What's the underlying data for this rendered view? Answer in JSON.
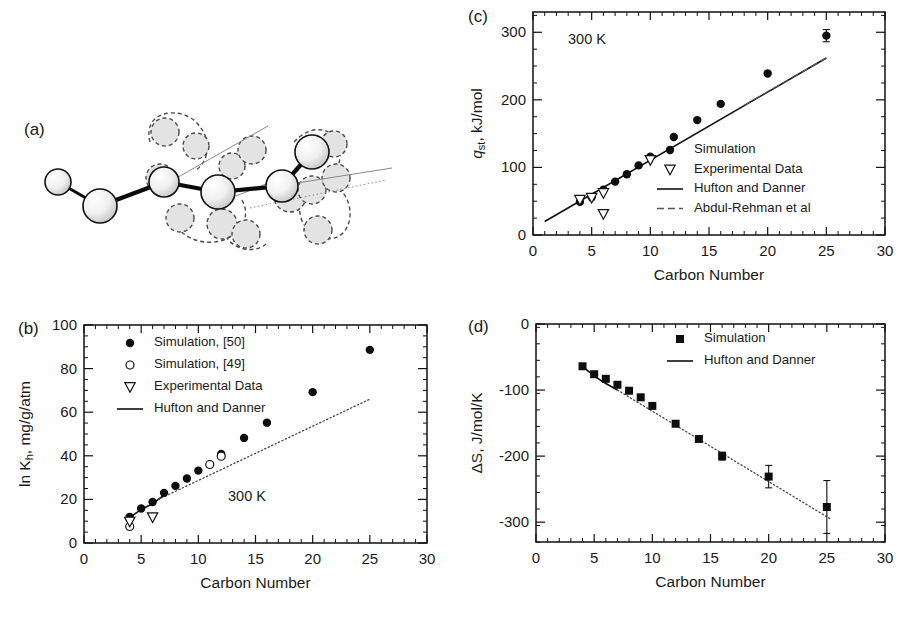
{
  "figure": {
    "panels": [
      "(a)",
      "(b)",
      "(c)",
      "(d)"
    ],
    "xlabel_common": "Carbon Number"
  },
  "panel_a": {
    "tag": "(a)",
    "caption_text": "",
    "description": "united-atom alkane chain schematic with ghost conformations",
    "solid_atoms": [
      {
        "cx": 58,
        "cy": 182,
        "r": 13
      },
      {
        "cx": 100,
        "cy": 206,
        "r": 17
      },
      {
        "cx": 164,
        "cy": 182,
        "r": 15
      },
      {
        "cx": 218,
        "cy": 192,
        "r": 17
      },
      {
        "cx": 282,
        "cy": 186,
        "r": 16
      },
      {
        "cx": 312,
        "cy": 152,
        "r": 17
      }
    ],
    "ghost_atoms": [
      {
        "cx": 165,
        "cy": 132,
        "r": 14
      },
      {
        "cx": 196,
        "cy": 146,
        "r": 13
      },
      {
        "cx": 160,
        "cy": 178,
        "r": 14
      },
      {
        "cx": 180,
        "cy": 218,
        "r": 14
      },
      {
        "cx": 222,
        "cy": 224,
        "r": 15
      },
      {
        "cx": 246,
        "cy": 234,
        "r": 14
      },
      {
        "cx": 232,
        "cy": 166,
        "r": 13
      },
      {
        "cx": 252,
        "cy": 150,
        "r": 14
      },
      {
        "cx": 290,
        "cy": 196,
        "r": 16
      },
      {
        "cx": 312,
        "cy": 190,
        "r": 14
      },
      {
        "cx": 318,
        "cy": 230,
        "r": 14
      },
      {
        "cx": 334,
        "cy": 144,
        "r": 13
      },
      {
        "cx": 336,
        "cy": 178,
        "r": 14
      }
    ],
    "ghost_loops": [
      "M150,142 C142,110 180,106 196,122 C214,140 208,162 196,170",
      "M176,206 C166,236 206,250 228,238 C250,226 248,206 240,198",
      "M226,216 C214,244 250,258 266,244",
      "M294,142 C316,118 344,132 340,158 C336,184 318,190 310,188",
      "M300,204 C296,234 330,248 344,232 C356,216 348,196 340,190"
    ],
    "guides": [
      {
        "x1": 166,
        "y1": 184,
        "x2": 268,
        "y2": 126,
        "style": "solid"
      },
      {
        "x1": 236,
        "y1": 196,
        "x2": 286,
        "y2": 176,
        "style": "solid"
      },
      {
        "x1": 278,
        "y1": 186,
        "x2": 392,
        "y2": 168,
        "style": "solid"
      },
      {
        "x1": 250,
        "y1": 208,
        "x2": 386,
        "y2": 180,
        "style": "dotted"
      }
    ]
  },
  "panel_b": {
    "tag": "(b)",
    "annotation": "300 K",
    "chart_data": {
      "type": "scatter",
      "title": "",
      "xlabel": "Carbon Number",
      "ylabel": "ln Kₕ, mg/g/atm",
      "ylabel_parts": {
        "pre": "ln K",
        "sub": "h",
        "post": ", mg/g/atm"
      },
      "xlim": [
        0,
        30
      ],
      "ylim": [
        0,
        100
      ],
      "xticks": [
        0,
        5,
        10,
        15,
        20,
        25,
        30
      ],
      "yticks": [
        0,
        20,
        40,
        60,
        80,
        100
      ],
      "xminor_step": 1,
      "yminor_step": 5,
      "grid": false,
      "legend_position": "top-left",
      "legend": [
        {
          "label": "Simulation,  [50]",
          "marker": "filled-circle"
        },
        {
          "label": "Simulation,  [49]",
          "marker": "open-circle"
        },
        {
          "label": "Experimental Data",
          "marker": "open-triangle-down"
        },
        {
          "label": "Hufton and Danner",
          "marker": "line"
        }
      ],
      "series": [
        {
          "name": "Simulation, [50]",
          "marker": "filled-circle",
          "x": [
            4,
            5,
            6,
            7,
            8,
            9,
            10,
            12,
            14,
            16,
            20,
            25
          ],
          "y": [
            12.0,
            15.8,
            18.8,
            23.0,
            26.2,
            29.6,
            33.2,
            40.8,
            48.2,
            55.2,
            69.2,
            88.6
          ]
        },
        {
          "name": "Simulation, [49]",
          "marker": "open-circle",
          "x": [
            4,
            11,
            12
          ],
          "y": [
            7.6,
            36.0,
            39.8
          ]
        },
        {
          "name": "Experimental Data",
          "marker": "open-triangle-down",
          "x": [
            4,
            6
          ],
          "y": [
            9.8,
            11.8
          ]
        }
      ],
      "lines": [
        {
          "name": "Hufton and Danner",
          "style": "solid",
          "x": [
            4,
            5,
            6,
            7
          ],
          "y": [
            11.6,
            15.4,
            18.0,
            22.0
          ]
        },
        {
          "name": "Hufton and Danner extrapolated",
          "style": "dotted",
          "x": [
            6.5,
            25
          ],
          "y": [
            20.0,
            66.0
          ]
        }
      ]
    }
  },
  "panel_c": {
    "tag": "(c)",
    "annotation": "300 K",
    "chart_data": {
      "type": "scatter",
      "title": "",
      "xlabel": "Carbon Number",
      "ylabel": "qₛₜ, kJ/mol",
      "ylabel_parts": {
        "pre": "q",
        "sub": "st",
        "post": ", kJ/mol"
      },
      "xlim": [
        0,
        30
      ],
      "ylim": [
        0,
        330
      ],
      "xticks": [
        0,
        5,
        10,
        15,
        20,
        25,
        30
      ],
      "yticks": [
        0,
        100,
        200,
        300
      ],
      "xminor_step": 1,
      "yminor_step": 25,
      "grid": false,
      "legend_position": "lower-right",
      "legend": [
        {
          "label": "Simulation",
          "marker": "filled-circle"
        },
        {
          "label": "Experimental Data",
          "marker": "open-triangle-down"
        },
        {
          "label": "Hufton and Danner",
          "marker": "line"
        },
        {
          "label": "Abdul-Rehman et al",
          "marker": "dashed-line"
        }
      ],
      "series": [
        {
          "name": "Simulation",
          "marker": "filled-circle",
          "x": [
            4,
            5,
            6,
            7,
            8,
            9,
            10,
            12,
            14,
            16,
            20,
            25
          ],
          "y": [
            49,
            56,
            67,
            79,
            90,
            103,
            116,
            145,
            170,
            194,
            239,
            295
          ],
          "yerr": [
            0,
            0,
            0,
            0,
            0,
            0,
            0,
            0,
            0,
            0,
            0,
            9
          ]
        },
        {
          "name": "Experimental Data",
          "marker": "open-triangle-down",
          "x": [
            4,
            5,
            6,
            6,
            10
          ],
          "y": [
            52,
            55,
            62,
            31,
            111
          ]
        }
      ],
      "lines": [
        {
          "name": "Hufton and Danner",
          "style": "solid",
          "x": [
            1,
            25
          ],
          "y": [
            20,
            262
          ]
        },
        {
          "name": "Abdul-Rehman et al",
          "style": "dashed",
          "x": [
            18,
            25
          ],
          "y": [
            192,
            262
          ]
        }
      ]
    }
  },
  "panel_d": {
    "tag": "(d)",
    "annotation": "",
    "chart_data": {
      "type": "scatter",
      "title": "",
      "xlabel": "Carbon Number",
      "ylabel": "ΔS, J/mol/K",
      "ylabel_parts": {
        "pre": "ΔS, J/mol/K",
        "sub": "",
        "post": ""
      },
      "xlim": [
        0,
        30
      ],
      "ylim": [
        -330,
        0
      ],
      "xticks": [
        0,
        5,
        10,
        15,
        20,
        25,
        30
      ],
      "yticks": [
        0,
        -100,
        -200,
        -300
      ],
      "xminor_step": 1,
      "yminor_step": 25,
      "grid": false,
      "legend_position": "top-right",
      "legend": [
        {
          "label": "Simulation",
          "marker": "filled-square"
        },
        {
          "label": "Hufton and Danner",
          "marker": "line"
        }
      ],
      "series": [
        {
          "name": "Simulation",
          "marker": "filled-square",
          "x": [
            4,
            5,
            6,
            7,
            8,
            9,
            10,
            12,
            14,
            16,
            20,
            25
          ],
          "y": [
            -64,
            -76,
            -83,
            -92,
            -101,
            -111,
            -124,
            -151,
            -174,
            -200,
            -231,
            -277
          ],
          "yerr": [
            0,
            0,
            0,
            0,
            0,
            0,
            0,
            0,
            0,
            6,
            17,
            40
          ]
        }
      ],
      "lines": [
        {
          "name": "Hufton and Danner",
          "style": "solid",
          "x": [
            4,
            5,
            6,
            7
          ],
          "y": [
            -64,
            -79,
            -90,
            -100
          ]
        },
        {
          "name": "Hufton and Danner extrapolated",
          "style": "dotted",
          "x": [
            7,
            25.4
          ],
          "y": [
            -100,
            -296
          ]
        }
      ]
    }
  }
}
